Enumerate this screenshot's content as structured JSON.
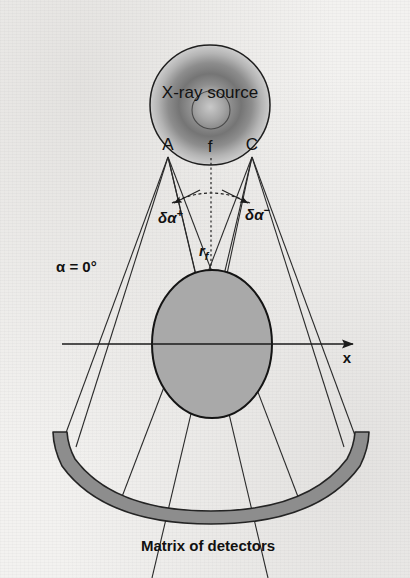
{
  "figure": {
    "domain_kind": "ct-scanner-geometry-diagram",
    "background_color": "#f3f2f0",
    "ink_color": "#111111",
    "labels": {
      "source": "X-ray source",
      "point_a": "A",
      "point_f": "f",
      "point_c": "C",
      "delta_alpha_plus": "δα",
      "delta_alpha_plus_sup": "+",
      "delta_alpha_minus": "δα",
      "delta_alpha_minus_sup": "−",
      "focal_radius": "r",
      "focal_radius_sub": "f",
      "alpha_angle": "α = 0°",
      "axis_x": "x",
      "detectors": "Matrix of detectors"
    },
    "colors": {
      "object_fill": "#a9a9a9",
      "object_stroke": "#141414",
      "detector_fill": "#8d8d8d",
      "detector_stroke": "#242424",
      "source_ring_dark": "#6f6f6f",
      "source_core_light": "#d8d8d8",
      "ray_stroke": "#2a2a2a"
    },
    "geometry": {
      "source_center_x": 210,
      "source_center_y": 105,
      "source_radius": 60,
      "source_core_radius": 19,
      "point_a_x": 168,
      "point_a_y": 157,
      "point_f_x": 210,
      "point_f_y": 160,
      "point_c_x": 252,
      "point_c_y": 157,
      "isocenter_x": 212,
      "isocenter_y": 344,
      "object_rx": 60,
      "object_ry": 74,
      "axis_start_x": 62,
      "axis_end_x": 357,
      "detector_left_x": 53,
      "detector_right_x": 368,
      "detector_end_y": 432,
      "detector_bottom_y": 512,
      "detector_band_thickness": 13
    }
  },
  "ghost_text": {
    "top": "",
    "right": "",
    "left": ""
  }
}
